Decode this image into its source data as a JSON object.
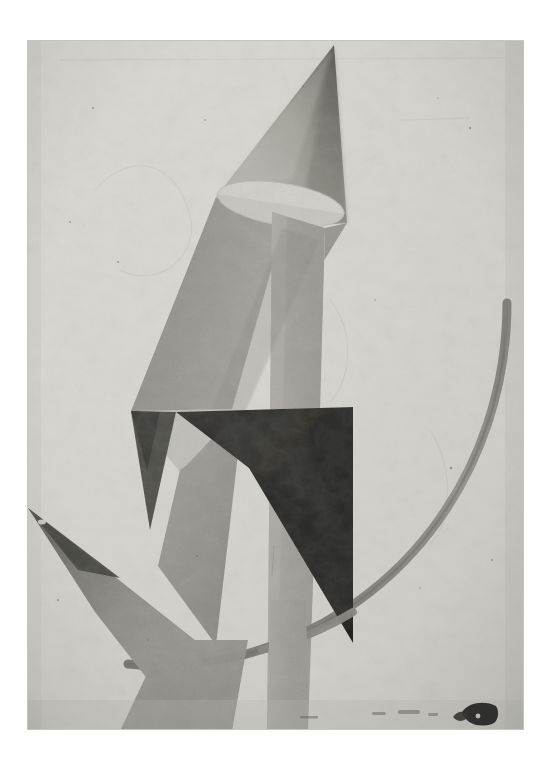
{
  "image": {
    "medium_type": "photograph-of-painting",
    "style": "abstract geometric / constructivist",
    "canvas_width": 550,
    "canvas_height": 759,
    "matte_color": "#ffffff",
    "painting_bounds": {
      "x": 27,
      "y": 40,
      "width": 497,
      "height": 690
    },
    "ground_color": "#dcdad5",
    "ground_shadow_color": "#c9c6c0"
  },
  "palette": {
    "background_light": "#dcdad5",
    "background_light_2": "#e2e0db",
    "pale_gray": "#d2d0ca",
    "mid_gray": "#8e8d88",
    "mid_gray_dark": "#76756f",
    "warm_gray": "#a3a09a",
    "deep_gray": "#5a5954",
    "near_black": "#141414",
    "black": "#0a0a0a",
    "cone_light": "#b7b5ae",
    "cone_dark": "#4e4d49",
    "column_gray": "#9d9b95",
    "arc_gray": "#84827c",
    "damage_black": "#1a1a1a"
  },
  "shapes": [
    {
      "id": "cone-body",
      "name": "cone-upper-triangle",
      "description": "Large cone / triangle rising to an apex at top center-right",
      "apex": [
        334,
        45
      ],
      "base_left": [
        216,
        199
      ],
      "base_right": [
        345,
        222
      ],
      "fill": "gradient-cone"
    },
    {
      "id": "cone-ellipse",
      "name": "cone-base-ellipse",
      "description": "Pale lens/ellipse forming the open base of the cone",
      "center": [
        280,
        205
      ],
      "rx": 64,
      "ry": 22,
      "rotation": 10,
      "fill": "#d8d6cf"
    },
    {
      "id": "left-wing",
      "name": "left-wing-quadrilateral",
      "description": "Mid-gray wedge falling from the cone base down-left",
      "points": "216,199 280,226 198,500 133,410",
      "fill": "gradient-wing"
    },
    {
      "id": "column",
      "name": "vertical-column",
      "description": "Narrow vertical gray column running from the cone base to the bottom edge",
      "points": "272,210 322,226 307,730 268,730",
      "fill": "gradient-column"
    },
    {
      "id": "right-facet",
      "name": "cone-right-facet",
      "description": "Darker facet on the right side of the cone descending to the black shape",
      "points": "334,45 345,222 322,226 318,410 300,300",
      "fill": "#8b8a84"
    },
    {
      "id": "pale-triangle",
      "name": "pale-upper-left-triangle",
      "description": "Pale triangular plane left of the black shape",
      "points": "133,410 238,410 178,470",
      "fill": "#c0beb7"
    },
    {
      "id": "black-shape",
      "name": "black-quadrilateral",
      "description": "Dominant black quadrilateral in the centre of the composition",
      "points": "176,412 353,408 353,642 250,470",
      "fill": "#111111"
    },
    {
      "id": "dark-sliver-top",
      "name": "dark-sliver-upper-left",
      "description": "Thin dark sliver pointing down from the upper-left of the black shape",
      "points": "133,410 176,412 143,520",
      "fill": "#3b3a36"
    },
    {
      "id": "lower-wedge",
      "name": "lower-mid-wedge",
      "description": "Mid-gray wedge descending from the pale triangle to lower right",
      "points": "178,468 240,430 213,640 160,560",
      "fill": "gradient-lowerwedge"
    },
    {
      "id": "left-spike",
      "name": "left-needle-spike",
      "description": "Long narrow spike entering from the left edge and reaching down-right",
      "points": "28,508 200,640 185,730 92,600",
      "fill": "gradient-spike"
    },
    {
      "id": "arc",
      "name": "large-circular-arc",
      "description": "Thin circular arc sweeping from upper right down and around to lower left",
      "start": [
        507,
        305
      ],
      "end": [
        130,
        665
      ],
      "radius": 235,
      "stroke": "#84827c",
      "stroke_width": 9
    },
    {
      "id": "damage",
      "name": "paint-loss-patch",
      "description": "Dark patch of paint loss / damage at the lower right of the canvas",
      "x": 462,
      "y": 703,
      "width": 36,
      "height": 21
    }
  ],
  "surface": {
    "texture": "aged canvas with craquelure",
    "vignette": true,
    "edge_wear": true
  }
}
